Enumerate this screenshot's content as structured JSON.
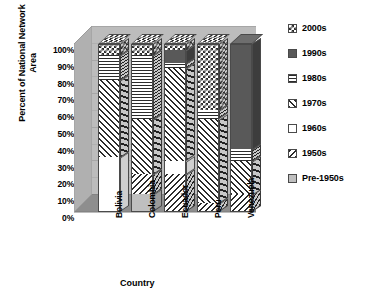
{
  "chart_data": {
    "type": "bar",
    "subtype": "stacked-column-3d",
    "title": "",
    "xlabel": "Country",
    "ylabel": "Percent of National Network Area",
    "categories": [
      "Bolivia",
      "Colombia",
      "Ecuador",
      "Peru",
      "Venezuela"
    ],
    "ylim": [
      0,
      100
    ],
    "yticks": [
      "0%",
      "10%",
      "20%",
      "30%",
      "40%",
      "50%",
      "60%",
      "70%",
      "80%",
      "90%",
      "100%"
    ],
    "ytick_values": [
      0,
      10,
      20,
      30,
      40,
      50,
      60,
      70,
      80,
      90,
      100
    ],
    "grid": true,
    "legend_position": "right",
    "legend_order_top_to_bottom": [
      "2000s",
      "1990s",
      "1980s",
      "1970s",
      "1960s",
      "1950s",
      "Pre-1950s"
    ],
    "stack_order_bottom_to_top": [
      "Pre-1950s",
      "1950s",
      "1960s",
      "1970s",
      "1980s",
      "1990s",
      "2000s"
    ],
    "series": [
      {
        "name": "Pre-1950s",
        "pattern": "solid-light-gray",
        "color": "#bfbfbf",
        "values": [
          0,
          10,
          0,
          0,
          0
        ]
      },
      {
        "name": "1950s",
        "pattern": "diagonal-hatch-backward",
        "color": "#2b2b2b",
        "values": [
          0,
          12,
          22,
          5,
          10
        ]
      },
      {
        "name": "1960s",
        "pattern": "solid-white",
        "color": "#ffffff",
        "values": [
          32,
          0,
          8,
          0,
          0
        ]
      },
      {
        "name": "1970s",
        "pattern": "diagonal-hatch-forward",
        "color": "#2b2b2b",
        "values": [
          46,
          33,
          55,
          50,
          20
        ]
      },
      {
        "name": "1980s",
        "pattern": "horizontal-lines",
        "color": "#2b2b2b",
        "values": [
          15,
          38,
          3,
          5,
          7
        ]
      },
      {
        "name": "1990s",
        "pattern": "solid-dark-gray",
        "color": "#595959",
        "values": [
          0,
          0,
          8,
          0,
          63
        ]
      },
      {
        "name": "2000s",
        "pattern": "checkerboard",
        "color": "#2b2b2b",
        "values": [
          7,
          7,
          4,
          40,
          0
        ]
      }
    ],
    "cumulative_tops": {
      "Bolivia": {
        "Pre-1950s": 0,
        "1950s": 0,
        "1960s": 32,
        "1970s": 78,
        "1980s": 93,
        "1990s": 93,
        "2000s": 100
      },
      "Colombia": {
        "Pre-1950s": 10,
        "1950s": 22,
        "1960s": 22,
        "1970s": 55,
        "1980s": 93,
        "1990s": 93,
        "2000s": 100
      },
      "Ecuador": {
        "Pre-1950s": 0,
        "1950s": 22,
        "1960s": 30,
        "1970s": 85,
        "1980s": 88,
        "1990s": 96,
        "2000s": 100
      },
      "Peru": {
        "Pre-1950s": 0,
        "1950s": 5,
        "1960s": 5,
        "1970s": 55,
        "1980s": 60,
        "1990s": 60,
        "2000s": 100
      },
      "Venezuela": {
        "Pre-1950s": 0,
        "1950s": 10,
        "1960s": 10,
        "1970s": 30,
        "1980s": 37,
        "1990s": 100,
        "2000s": 100
      }
    }
  },
  "legend": {
    "items": [
      {
        "label": "2000s"
      },
      {
        "label": "1990s"
      },
      {
        "label": "1980s"
      },
      {
        "label": "1970s"
      },
      {
        "label": "1960s"
      },
      {
        "label": "1950s"
      },
      {
        "label": "Pre-1950s"
      }
    ]
  },
  "axes": {
    "y_title_line1": "Percent of National Network",
    "y_title_line2": "Area",
    "x_title": "Country"
  },
  "colors": {
    "plot_back_wall": "#bcbcbc",
    "plot_side_wall": "#b0b0b0",
    "plot_floor": "#8e8e8e",
    "gridline": "#a2a2a2",
    "outline": "#4a4a4a",
    "text": "#000000"
  }
}
